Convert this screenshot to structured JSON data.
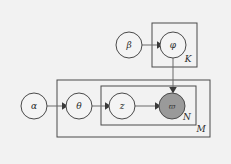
{
  "figure": {
    "background_color": "#f2f2f2",
    "node_fill": "#f4f4f4",
    "observed_fill": "#9a9a9a",
    "stroke_color": "#4a4a4a",
    "edge_color": "#6b6b6b"
  },
  "nodes": [
    {
      "id": "beta",
      "label": "β",
      "cx": 129,
      "cy": 45,
      "r": 13,
      "observed": false
    },
    {
      "id": "phi",
      "label": "φ",
      "cx": 173,
      "cy": 45,
      "r": 13,
      "observed": false
    },
    {
      "id": "alpha",
      "label": "α",
      "cx": 34,
      "cy": 106,
      "r": 13,
      "observed": false
    },
    {
      "id": "theta",
      "label": "θ",
      "cx": 79,
      "cy": 106,
      "r": 13,
      "observed": false
    },
    {
      "id": "z",
      "label": "z",
      "cx": 122,
      "cy": 106,
      "r": 13,
      "observed": false
    },
    {
      "id": "w",
      "label": "ϖ",
      "cx": 172,
      "cy": 106,
      "r": 13,
      "observed": true
    }
  ],
  "plates": [
    {
      "id": "plate-k",
      "label": "K",
      "x": 152,
      "y": 23,
      "width": 45,
      "height": 44,
      "label_x": 188,
      "label_y": 59
    },
    {
      "id": "plate-m",
      "label": "M",
      "x": 57,
      "y": 80,
      "width": 153,
      "height": 57,
      "label_x": 201,
      "label_y": 129
    },
    {
      "id": "plate-n",
      "label": "N",
      "x": 101,
      "y": 86,
      "width": 95,
      "height": 39,
      "label_x": 187,
      "label_y": 117
    }
  ],
  "edges": [
    {
      "id": "beta-to-phi",
      "from": "beta",
      "to": "phi",
      "kind": "horizontal"
    },
    {
      "id": "alpha-to-theta",
      "from": "alpha",
      "to": "theta",
      "kind": "horizontal"
    },
    {
      "id": "theta-to-z",
      "from": "theta",
      "to": "z",
      "kind": "horizontal"
    },
    {
      "id": "z-to-w",
      "from": "z",
      "to": "w",
      "kind": "horizontal"
    },
    {
      "id": "phi-to-w",
      "from": "phi",
      "to": "w",
      "kind": "vertical"
    }
  ],
  "legend": {
    "observed_note": "shaded node is observed",
    "latent_note": "unshaded nodes are latent"
  }
}
